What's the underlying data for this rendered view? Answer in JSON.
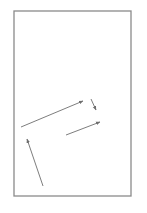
{
  "canvas": {
    "width": 147,
    "height": 213,
    "background": "#ffffff"
  },
  "frame": {
    "x": 14,
    "y": 11,
    "width": 117,
    "height": 185,
    "stroke": "#8a8a8a",
    "stroke_width": 1.3
  },
  "arrow_color": "#6e6e6e",
  "arrows": [
    {
      "id": "arrow-1",
      "x1": 21,
      "y1": 127,
      "x2": 83,
      "y2": 101
    },
    {
      "id": "arrow-2",
      "x1": 91,
      "y1": 99,
      "x2": 96,
      "y2": 110
    },
    {
      "id": "arrow-3",
      "x1": 66,
      "y1": 135,
      "x2": 100,
      "y2": 122
    },
    {
      "id": "arrow-4",
      "x1": 43,
      "y1": 186,
      "x2": 27,
      "y2": 139
    }
  ]
}
